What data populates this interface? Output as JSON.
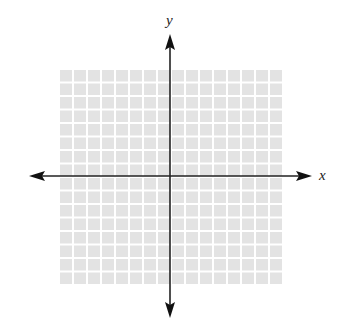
{
  "diagram": {
    "type": "cartesian-coordinate-plane",
    "grid": {
      "columns": 16,
      "rows": 16,
      "cell_color": "#e3e3e3",
      "line_color": "#ffffff",
      "left": 59,
      "top": 69,
      "width": 224,
      "height": 216
    },
    "axes": {
      "color": "#222222",
      "origin_x": 170,
      "origin_y": 176,
      "x_label": "x",
      "y_label": "y"
    }
  }
}
